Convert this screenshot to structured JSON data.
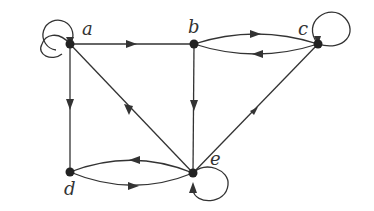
{
  "diagram": {
    "type": "directed-graph",
    "nodes": [
      {
        "id": "a",
        "label": "a",
        "x": 70,
        "y": 44
      },
      {
        "id": "b",
        "label": "b",
        "x": 194,
        "y": 44
      },
      {
        "id": "c",
        "label": "c",
        "x": 318,
        "y": 44
      },
      {
        "id": "d",
        "label": "d",
        "x": 70,
        "y": 172
      },
      {
        "id": "e",
        "label": "e",
        "x": 193,
        "y": 173
      }
    ],
    "edges": [
      {
        "from": "a",
        "to": "a",
        "kind": "loop"
      },
      {
        "from": "a",
        "to": "b"
      },
      {
        "from": "a",
        "to": "d"
      },
      {
        "from": "e",
        "to": "a"
      },
      {
        "from": "b",
        "to": "c",
        "kind": "curved"
      },
      {
        "from": "c",
        "to": "b",
        "kind": "curved"
      },
      {
        "from": "c",
        "to": "c",
        "kind": "loop"
      },
      {
        "from": "b",
        "to": "e"
      },
      {
        "from": "c",
        "to": "e"
      },
      {
        "from": "e",
        "to": "d",
        "kind": "curved"
      },
      {
        "from": "d",
        "to": "e",
        "kind": "curved"
      },
      {
        "from": "e",
        "to": "e",
        "kind": "loop"
      }
    ],
    "colors": {
      "stroke": "#333333",
      "node": "#222222"
    }
  }
}
